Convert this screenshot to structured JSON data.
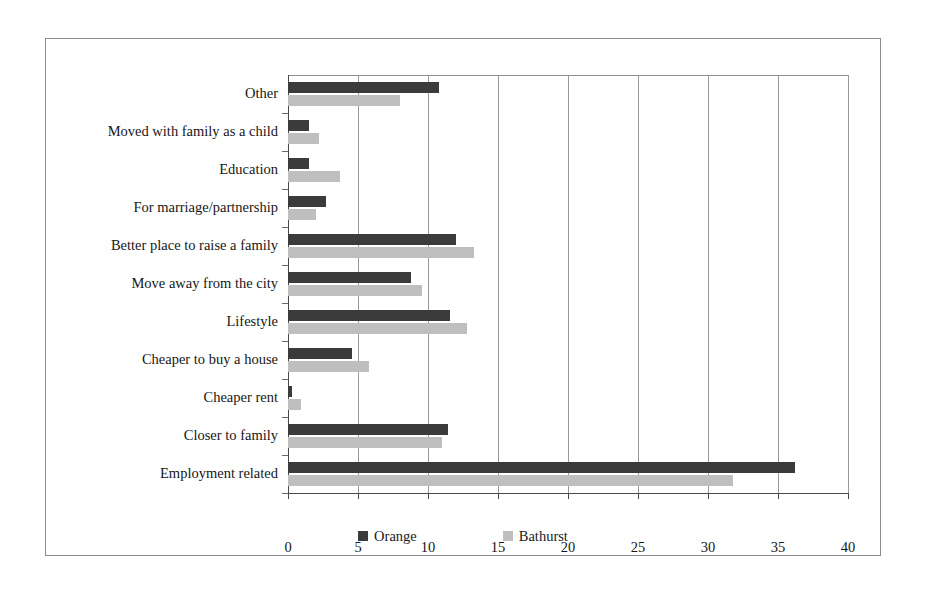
{
  "chart_data": {
    "type": "bar",
    "orientation": "horizontal",
    "title": "",
    "xlabel": "",
    "ylabel": "",
    "xlim": [
      0,
      40
    ],
    "xticks": [
      0,
      5,
      10,
      15,
      20,
      25,
      30,
      35,
      40
    ],
    "grid": true,
    "legend_position": "bottom",
    "categories": [
      "Other",
      "Moved with family as a child",
      "Education",
      "For marriage/partnership",
      "Better place to raise a family",
      "Move away from the city",
      "Lifestyle",
      "Cheaper to buy a house",
      "Cheaper rent",
      "Closer to family",
      "Employment related"
    ],
    "series": [
      {
        "name": "Orange",
        "color": "#3b3b3b",
        "values": [
          10.8,
          1.5,
          1.5,
          2.7,
          12.0,
          8.8,
          11.6,
          4.6,
          0.3,
          11.4,
          36.2
        ]
      },
      {
        "name": "Bathurst",
        "color": "#bfbfbf",
        "values": [
          8.0,
          2.2,
          3.7,
          2.0,
          13.3,
          9.6,
          12.8,
          5.8,
          0.9,
          11.0,
          31.8
        ]
      }
    ]
  },
  "legend": {
    "items": [
      {
        "label": "Orange",
        "color": "#3b3b3b"
      },
      {
        "label": "Bathurst",
        "color": "#bfbfbf"
      }
    ]
  }
}
